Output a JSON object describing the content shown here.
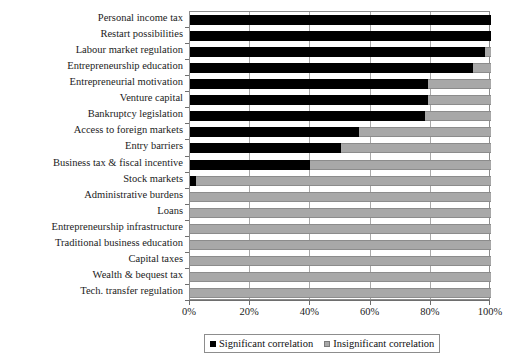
{
  "chart_data": {
    "type": "bar",
    "orientation": "horizontal",
    "stacked": true,
    "title": "",
    "xlabel": "",
    "ylabel": "",
    "xlim": [
      0,
      100
    ],
    "xticks": [
      "0%",
      "20%",
      "40%",
      "60%",
      "80%",
      "100%"
    ],
    "xtick_values": [
      0,
      20,
      40,
      60,
      80,
      100
    ],
    "grid": "vertical",
    "legend_position": "bottom-center",
    "categories": [
      "Personal income tax",
      "Restart possibilities",
      "Labour market regulation",
      "Entrepreneurship education",
      "Entrepreneurial motivation",
      "Venture capital",
      "Bankruptcy legislation",
      "Access to foreign markets",
      "Entry barriers",
      "Business tax & fiscal incentive",
      "Stock markets",
      "Administrative burdens",
      "Loans",
      "Entrepreneurship infrastructure",
      "Traditional business education",
      "Capital taxes",
      "Wealth & bequest tax",
      "Tech. transfer regulation"
    ],
    "series": [
      {
        "name": "Significant correlation",
        "color": "#000000",
        "values": [
          100,
          100,
          98,
          94,
          79,
          79,
          78,
          56,
          50,
          40,
          2,
          0,
          0,
          0,
          0,
          0,
          0,
          0
        ]
      },
      {
        "name": "Insignificant correlation",
        "color": "#a8a8a8",
        "values": [
          0,
          0,
          2,
          6,
          21,
          21,
          22,
          44,
          50,
          60,
          98,
          100,
          100,
          100,
          100,
          100,
          100,
          100
        ]
      }
    ]
  },
  "legend": {
    "items": [
      {
        "label": "Significant correlation",
        "swatch": "black"
      },
      {
        "label": "Insignificant correlation",
        "swatch": "gray"
      }
    ]
  }
}
